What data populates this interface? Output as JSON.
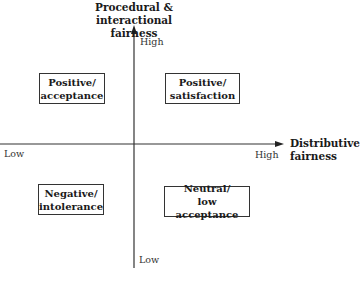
{
  "diagram": {
    "y_axis": {
      "title_line1": "Procedural &",
      "title_line2": "interactional fairness",
      "high_label": "High",
      "low_label": "Low"
    },
    "x_axis": {
      "title_line1": "Distributive",
      "title_line2": "fairness",
      "high_label": "High",
      "low_label": "Low"
    },
    "quadrants": [
      {
        "position": "top-left",
        "line1": "Positive/",
        "line2": "acceptance"
      },
      {
        "position": "top-right",
        "line1": "Positive/",
        "line2": "satisfaction"
      },
      {
        "position": "bottom-left",
        "line1": "Negative/",
        "line2": "intolerance"
      },
      {
        "position": "bottom-right",
        "line1": "Neutral/",
        "line2": "low acceptance"
      }
    ],
    "colors": {
      "axis": "#333333",
      "box_border": "#333333",
      "text": "#1a1a1a"
    }
  }
}
